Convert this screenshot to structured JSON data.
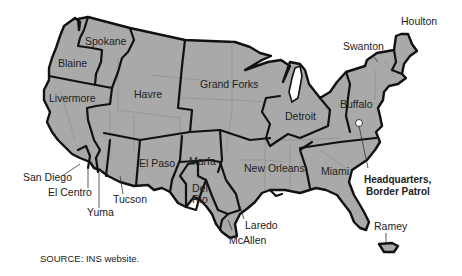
{
  "map": {
    "title": "U.S. Border Patrol Sectors",
    "fill_color": "#a9a9a9",
    "border_color": "#111111",
    "sectors": [
      {
        "name": "Spokane"
      },
      {
        "name": "Blaine"
      },
      {
        "name": "Havre"
      },
      {
        "name": "Grand Forks"
      },
      {
        "name": "Detroit"
      },
      {
        "name": "Buffalo"
      },
      {
        "name": "Swanton"
      },
      {
        "name": "Houlton"
      },
      {
        "name": "Livermore"
      },
      {
        "name": "San Diego"
      },
      {
        "name": "El Centro"
      },
      {
        "name": "Yuma"
      },
      {
        "name": "Tucson"
      },
      {
        "name": "El Paso"
      },
      {
        "name": "Marfa"
      },
      {
        "name": "Del Rio"
      },
      {
        "name": "Laredo"
      },
      {
        "name": "McAllen"
      },
      {
        "name": "New Orleans"
      },
      {
        "name": "Miami"
      },
      {
        "name": "Ramey"
      }
    ],
    "labels": {
      "spokane": "Spokane",
      "blaine": "Blaine",
      "havre": "Havre",
      "grand_forks": "Grand Forks",
      "detroit": "Detroit",
      "buffalo": "Buffalo",
      "swanton": "Swanton",
      "houlton": "Houlton",
      "livermore": "Livermore",
      "san_diego": "San Diego",
      "el_centro": "El Centro",
      "yuma": "Yuma",
      "tucson": "Tucson",
      "el_paso": "El Paso",
      "marfa": "Marfa",
      "del": "Del",
      "rio": "Rio",
      "laredo": "Laredo",
      "mcallen": "McAllen",
      "new_orleans": "New Orleans",
      "miami": "Miami",
      "ramey": "Ramey",
      "hq_line1": "Headquarters,",
      "hq_line2": "Border Patrol"
    },
    "source": "SOURCE:  INS website."
  }
}
